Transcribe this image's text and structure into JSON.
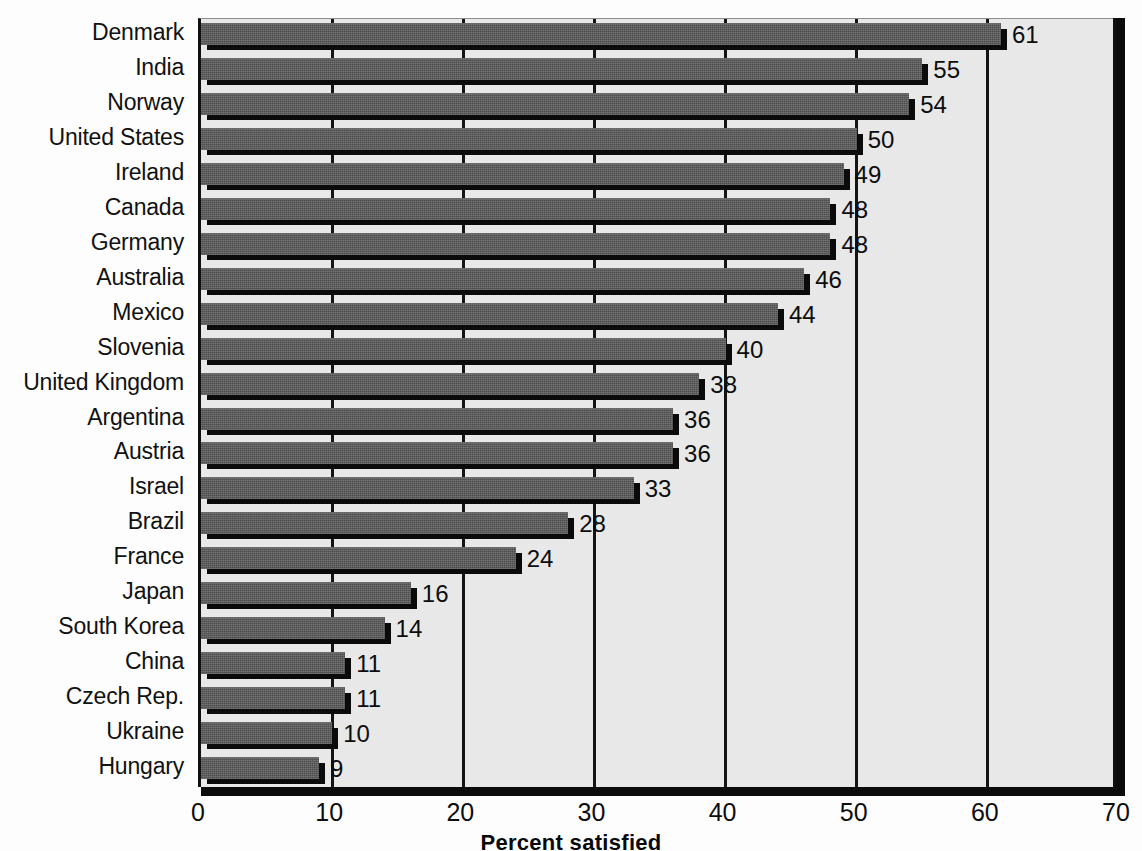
{
  "chart_data": {
    "type": "bar",
    "orientation": "horizontal",
    "title": "",
    "xlabel": "Percent satisfied",
    "ylabel": "",
    "xlim": [
      0,
      70
    ],
    "xticks": [
      "0",
      "10",
      "20",
      "30",
      "40",
      "50",
      "60",
      "70"
    ],
    "grid": true,
    "legend": false,
    "categories": [
      "Denmark",
      "India",
      "Norway",
      "United States",
      "Ireland",
      "Canada",
      "Germany",
      "Australia",
      "Mexico",
      "Slovenia",
      "United Kingdom",
      "Argentina",
      "Austria",
      "Israel",
      "Brazil",
      "France",
      "Japan",
      "South Korea",
      "China",
      "Czech Rep.",
      "Ukraine",
      "Hungary"
    ],
    "values": [
      61,
      55,
      54,
      50,
      49,
      48,
      48,
      46,
      44,
      40,
      38,
      36,
      36,
      33,
      28,
      24,
      16,
      14,
      11,
      11,
      10,
      9
    ],
    "value_labels": [
      "61",
      "55",
      "54",
      "50",
      "49",
      "48",
      "48",
      "46",
      "44",
      "40",
      "38",
      "36",
      "36",
      "33",
      "28",
      "24",
      "16",
      "14",
      "11",
      "11",
      "10",
      "9"
    ],
    "colors": {
      "bar_fill": "#565656",
      "bar_shadow": "#0b0b0b",
      "plot_background": "#e8e8e8",
      "page_background": "#fdfdfd",
      "gridline": "#141414",
      "text": "#0d0d0d"
    }
  }
}
